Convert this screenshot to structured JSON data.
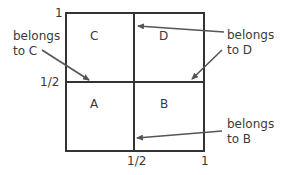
{
  "diagram": {
    "axis_labels": {
      "y_top": "1",
      "y_mid": "1/2",
      "x_mid": "1/2",
      "x_right": "1"
    },
    "regions": {
      "A": "A",
      "B": "B",
      "C": "C",
      "D": "D"
    },
    "annotations": {
      "c": {
        "line1": "belongs",
        "line2": "to C"
      },
      "d": {
        "line1": "belongs",
        "line2": "to D"
      },
      "b": {
        "line1": "belongs",
        "line2": "to B"
      }
    },
    "colors": {
      "line": "#333333",
      "arrow": "#555555",
      "text": "#3a3a3a",
      "background": "#ffffff"
    }
  }
}
